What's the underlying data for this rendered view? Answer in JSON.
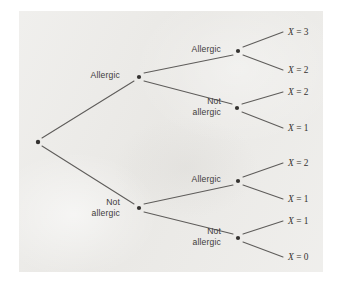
{
  "figure": {
    "panel": {
      "background_color": "#ebeae7",
      "page_color": "#ffffff",
      "x": 19,
      "y": 11,
      "width": 304,
      "height": 261
    },
    "style": {
      "edge_color": "#5e5c5a",
      "node_color": "#343230",
      "branch_label_color": "#3d3b39",
      "outcome_label_color": "#35332f"
    }
  },
  "chart_data": {
    "type": "diagram",
    "diagram_kind": "probability-tree",
    "title": "",
    "levels": 3,
    "branch_labels": [
      "Allergic",
      "Not allergic"
    ],
    "outcome_variable": "X",
    "nodes": [
      {
        "id": "root",
        "x": 38,
        "y": 142,
        "label": "",
        "level": 0
      },
      {
        "id": "n-A",
        "x": 139,
        "y": 77,
        "label": "Allergic",
        "label_lines": [
          "Allergic"
        ],
        "label_x": 120,
        "label_y": 78,
        "level": 1,
        "anchor": "end"
      },
      {
        "id": "n-N",
        "x": 139,
        "y": 208,
        "label": "Not allergic",
        "label_lines": [
          "Not",
          "allergic"
        ],
        "label_x": 120,
        "label_y": 205,
        "level": 1,
        "anchor": "end"
      },
      {
        "id": "n-AA",
        "x": 238,
        "y": 51,
        "label": "Allergic",
        "label_lines": [
          "Allergic"
        ],
        "label_x": 221,
        "label_y": 52,
        "level": 2,
        "anchor": "end"
      },
      {
        "id": "n-AN",
        "x": 237,
        "y": 108,
        "label": "Not allergic",
        "label_lines": [
          "Not",
          "allergic"
        ],
        "label_x": 221,
        "label_y": 104,
        "level": 2,
        "anchor": "end"
      },
      {
        "id": "n-NA",
        "x": 238,
        "y": 181,
        "label": "Allergic",
        "label_lines": [
          "Allergic"
        ],
        "label_x": 221,
        "label_y": 182,
        "level": 2,
        "anchor": "end"
      },
      {
        "id": "n-NN",
        "x": 238,
        "y": 238,
        "label": "Not allergic",
        "label_lines": [
          "Not",
          "allergic"
        ],
        "label_x": 221,
        "label_y": 234,
        "level": 2,
        "anchor": "end"
      }
    ],
    "edges": [
      {
        "from": "root",
        "to": "n-A",
        "x1": 42,
        "y1": 138,
        "x2": 134,
        "y2": 81
      },
      {
        "from": "root",
        "to": "n-N",
        "x1": 42,
        "y1": 146,
        "x2": 134,
        "y2": 204
      },
      {
        "from": "n-A",
        "to": "n-AA",
        "x1": 144,
        "y1": 73,
        "x2": 233,
        "y2": 55
      },
      {
        "from": "n-A",
        "to": "n-AN",
        "x1": 144,
        "y1": 81,
        "x2": 232,
        "y2": 104
      },
      {
        "from": "n-N",
        "to": "n-NA",
        "x1": 144,
        "y1": 204,
        "x2": 233,
        "y2": 185
      },
      {
        "from": "n-N",
        "to": "n-NN",
        "x1": 144,
        "y1": 212,
        "x2": 233,
        "y2": 234
      },
      {
        "from": "n-AA",
        "to": "leaf-1",
        "x1": 243,
        "y1": 47,
        "x2": 283,
        "y2": 32
      },
      {
        "from": "n-AA",
        "to": "leaf-2",
        "x1": 243,
        "y1": 55,
        "x2": 283,
        "y2": 70
      },
      {
        "from": "n-AN",
        "to": "leaf-3",
        "x1": 242,
        "y1": 104,
        "x2": 283,
        "y2": 92
      },
      {
        "from": "n-AN",
        "to": "leaf-4",
        "x1": 242,
        "y1": 112,
        "x2": 283,
        "y2": 128
      },
      {
        "from": "n-NA",
        "to": "leaf-5",
        "x1": 243,
        "y1": 177,
        "x2": 283,
        "y2": 163
      },
      {
        "from": "n-NA",
        "to": "leaf-6",
        "x1": 243,
        "y1": 185,
        "x2": 283,
        "y2": 199
      },
      {
        "from": "n-NN",
        "to": "leaf-7",
        "x1": 243,
        "y1": 234,
        "x2": 283,
        "y2": 221
      },
      {
        "from": "n-NN",
        "to": "leaf-8",
        "x1": 243,
        "y1": 242,
        "x2": 283,
        "y2": 257
      }
    ],
    "outcomes": [
      {
        "id": "leaf-1",
        "var": "X",
        "rel": "=",
        "value": "3",
        "text": "X = 3",
        "x": 288,
        "y": 35,
        "path": [
          "Allergic",
          "Allergic",
          "Allergic"
        ]
      },
      {
        "id": "leaf-2",
        "var": "X",
        "rel": "=",
        "value": "2",
        "text": "X = 2",
        "x": 288,
        "y": 73,
        "path": [
          "Allergic",
          "Allergic",
          "Not allergic"
        ]
      },
      {
        "id": "leaf-3",
        "var": "X",
        "rel": "=",
        "value": "2",
        "text": "X = 2",
        "x": 288,
        "y": 95,
        "path": [
          "Allergic",
          "Not allergic",
          "Allergic"
        ]
      },
      {
        "id": "leaf-4",
        "var": "X",
        "rel": "=",
        "value": "1",
        "text": "X = 1",
        "x": 288,
        "y": 131,
        "path": [
          "Allergic",
          "Not allergic",
          "Not allergic"
        ]
      },
      {
        "id": "leaf-5",
        "var": "X",
        "rel": "=",
        "value": "2",
        "text": "X = 2",
        "x": 288,
        "y": 166,
        "path": [
          "Not allergic",
          "Allergic",
          "Allergic"
        ]
      },
      {
        "id": "leaf-6",
        "var": "X",
        "rel": "=",
        "value": "1",
        "text": "X = 1",
        "x": 288,
        "y": 202,
        "path": [
          "Not allergic",
          "Allergic",
          "Not allergic"
        ]
      },
      {
        "id": "leaf-7",
        "var": "X",
        "rel": "=",
        "value": "1",
        "text": "X = 1",
        "x": 288,
        "y": 224,
        "path": [
          "Not allergic",
          "Not allergic",
          "Allergic"
        ]
      },
      {
        "id": "leaf-8",
        "var": "X",
        "rel": "=",
        "value": "0",
        "text": "X = 0",
        "x": 288,
        "y": 260,
        "path": [
          "Not allergic",
          "Not allergic",
          "Not allergic"
        ]
      }
    ]
  }
}
